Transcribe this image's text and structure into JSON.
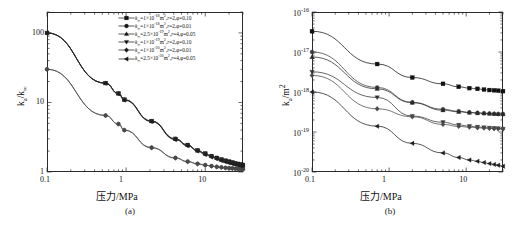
{
  "figure": {
    "panels": [
      {
        "caption": "(a)",
        "xlabel": "压力/MPa",
        "ylabel_html": "k<sub>a</sub>/k<sub>∞</sub>",
        "xticks": [
          "0.1",
          "1",
          "10"
        ],
        "yticks": [
          "1",
          "10",
          "100"
        ]
      },
      {
        "caption": "(b)",
        "xlabel": "压力/MPa",
        "ylabel_html": "k<sub>a</sub>/m<sup>2</sup>",
        "xticks": [
          "0.1",
          "1",
          "10"
        ],
        "yticks": [
          "10<sup>-20</sup>",
          "10<sup>-19</sup>",
          "10<sup>-18</sup>",
          "10<sup>-17</sup>",
          "10<sup>-16</sup>"
        ]
      }
    ],
    "legend_entries": [
      {
        "marker": "square",
        "text_html": "<i>k</i><sub>∞</sub>=1×10<sup>-18</sup>m<sup>2</sup>,<i>r</i>=2,<i>φ</i>=0.10"
      },
      {
        "marker": "circle",
        "text_html": "<i>k</i><sub>∞</sub>=1×10<sup>-18</sup>m<sup>2</sup>,<i>r</i>=2,<i>φ</i>=0.01"
      },
      {
        "marker": "triangle-up",
        "text_html": "<i>k</i><sub>∞</sub>=2.5×10<sup>-19</sup>m<sup>2</sup>,<i>r</i>=4,<i>φ</i>=0.05"
      },
      {
        "marker": "triangle-down",
        "text_html": "<i>k</i><sub>∞</sub>=1×10<sup>-19</sup>m<sup>2</sup>,<i>r</i>=2,<i>φ</i>=0.10"
      },
      {
        "marker": "diamond",
        "text_html": "<i>k</i><sub>∞</sub>=1×10<sup>-20</sup>m<sup>2</sup>,<i>r</i>=2,<i>φ</i>=0.01"
      },
      {
        "marker": "triangle-left",
        "text_html": "<i>k</i><sub>∞</sub>=2.5×10<sup>-20</sup>m<sup>2</sup>,<i>r</i>=4,<i>φ</i>=0.05"
      }
    ]
  },
  "chart_data": [
    {
      "type": "line",
      "panel": "a",
      "title": "",
      "xlabel": "压力/MPa",
      "ylabel": "k_a/k_inf",
      "xscale": "log",
      "yscale": "log",
      "xlim": [
        0.1,
        30
      ],
      "ylim": [
        1,
        200
      ],
      "grid": false,
      "legend_position": "top-right",
      "x": [
        0.1,
        0.55,
        0.8,
        0.95,
        2.1,
        4.2,
        6.0,
        8.0,
        10.0,
        12.0,
        14.0,
        16.0,
        18.0,
        20.0,
        22.0,
        24.0,
        26.0,
        28.0,
        30.0
      ],
      "series": [
        {
          "name": "k_inf=1e-18 m2, r=2, phi=0.10",
          "marker": "square",
          "values": [
            100,
            19.0,
            13.5,
            11.0,
            5.4,
            3.0,
            2.45,
            2.05,
            1.85,
            1.7,
            1.6,
            1.52,
            1.46,
            1.42,
            1.38,
            1.34,
            1.31,
            1.29,
            1.27
          ]
        },
        {
          "name": "k_inf=1e-18 m2, r=2, phi=0.01",
          "marker": "circle",
          "values": [
            30,
            6.5,
            4.9,
            4.0,
            2.25,
            1.6,
            1.42,
            1.32,
            1.26,
            1.22,
            1.19,
            1.17,
            1.15,
            1.14,
            1.13,
            1.12,
            1.11,
            1.1,
            1.1
          ]
        },
        {
          "name": "k_inf=2.5e-19 m2, r=4, phi=0.05",
          "marker": "triangle-up",
          "values": [
            100,
            19.0,
            13.5,
            11.0,
            5.4,
            3.0,
            2.45,
            2.05,
            1.84,
            1.69,
            1.58,
            1.5,
            1.44,
            1.39,
            1.35,
            1.32,
            1.29,
            1.27,
            1.25
          ]
        },
        {
          "name": "k_inf=1e-19 m2, r=2, phi=0.10",
          "marker": "triangle-down",
          "values": [
            100,
            19.0,
            13.4,
            10.9,
            5.35,
            2.95,
            2.4,
            2.02,
            1.8,
            1.66,
            1.56,
            1.48,
            1.42,
            1.37,
            1.33,
            1.3,
            1.27,
            1.25,
            1.23
          ]
        },
        {
          "name": "k_inf=1e-20 m2, r=2, phi=0.01",
          "marker": "diamond",
          "values": [
            30,
            6.5,
            4.9,
            4.0,
            2.22,
            1.58,
            1.4,
            1.3,
            1.25,
            1.21,
            1.18,
            1.16,
            1.14,
            1.13,
            1.12,
            1.11,
            1.1,
            1.09,
            1.09
          ]
        },
        {
          "name": "k_inf=2.5e-20 m2, r=4, phi=0.05",
          "marker": "triangle-left",
          "values": [
            100,
            18.8,
            13.3,
            10.8,
            5.3,
            2.92,
            2.38,
            2.0,
            1.78,
            1.64,
            1.54,
            1.46,
            1.4,
            1.35,
            1.31,
            1.28,
            1.25,
            1.23,
            1.21
          ]
        }
      ]
    },
    {
      "type": "line",
      "panel": "b",
      "title": "",
      "xlabel": "压力/MPa",
      "ylabel": "k_a/m^2",
      "xscale": "log",
      "yscale": "log",
      "xlim": [
        0.1,
        30
      ],
      "ylim": [
        1e-20,
        1e-16
      ],
      "grid": false,
      "legend_position": "top-right",
      "x": [
        0.1,
        0.7,
        2.0,
        5.0,
        8.0,
        11.0,
        14.0,
        17.0,
        20.0,
        23.0,
        26.0,
        30.0
      ],
      "series": [
        {
          "name": "k_inf=1e-18 m2, r=2, phi=0.10",
          "marker": "square",
          "values": [
            3.3e-17,
            5e-18,
            2.3e-18,
            1.6e-18,
            1.35e-18,
            1.25e-18,
            1.2e-18,
            1.15e-18,
            1.12e-18,
            1.1e-18,
            1.08e-18,
            1.05e-18
          ]
        },
        {
          "name": "k_inf=1e-18 m2, r=2, phi=0.01",
          "marker": "circle",
          "values": [
            1e-17,
            1.3e-18,
            5.5e-19,
            3.7e-19,
            3.3e-19,
            3.1e-19,
            3e-19,
            2.95e-19,
            2.9e-19,
            2.85e-19,
            2.82e-19,
            2.8e-19
          ]
        },
        {
          "name": "k_inf=2.5e-19 m2, r=4, phi=0.05",
          "marker": "triangle-up",
          "values": [
            7.5e-18,
            1.2e-18,
            5.4e-19,
            3.5e-19,
            3.2e-19,
            3.05e-19,
            2.98e-19,
            2.92e-19,
            2.88e-19,
            2.85e-19,
            2.82e-19,
            2.8e-19
          ]
        },
        {
          "name": "k_inf=1e-19 m2, r=2, phi=0.10",
          "marker": "triangle-down",
          "values": [
            3.2e-18,
            7.3e-19,
            2.5e-19,
            1.75e-19,
            1.5e-19,
            1.4e-19,
            1.34e-19,
            1.3e-19,
            1.27e-19,
            1.25e-19,
            1.23e-19,
            1.2e-19
          ]
        },
        {
          "name": "k_inf=1e-20 m2, r=2, phi=0.01",
          "marker": "diamond",
          "values": [
            2.6e-18,
            3.8e-19,
            2.4e-19,
            1.55e-19,
            1.38e-19,
            1.32e-19,
            1.28e-19,
            1.25e-19,
            1.23e-19,
            1.21e-19,
            1.2e-19,
            1.18e-19
          ]
        },
        {
          "name": "k_inf=2.5e-20 m2, r=4, phi=0.05",
          "marker": "triangle-left",
          "values": [
            1e-18,
            1.4e-19,
            5.2e-20,
            3e-20,
            2.3e-20,
            2e-20,
            1.85e-20,
            1.72e-20,
            1.62e-20,
            1.55e-20,
            1.48e-20,
            1.4e-20
          ]
        }
      ]
    }
  ]
}
